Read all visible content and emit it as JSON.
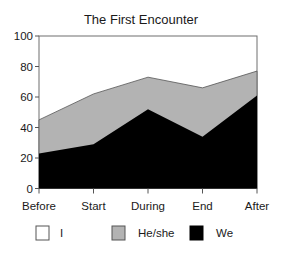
{
  "chart_data": {
    "type": "area",
    "stacked": true,
    "title": "The First Encounter",
    "xlabel": "",
    "ylabel": "",
    "categories": [
      "Before",
      "Start",
      "During",
      "End",
      "After"
    ],
    "ylim": [
      0,
      100
    ],
    "yticks": [
      0,
      20,
      40,
      60,
      80,
      100
    ],
    "grid": false,
    "legend_position": "bottom",
    "series": [
      {
        "name": "We",
        "color": "#000000",
        "values": [
          23,
          29,
          52,
          34,
          61
        ]
      },
      {
        "name": "He/she",
        "color": "#b3b3b3",
        "values": [
          22,
          33,
          21,
          32,
          16
        ]
      },
      {
        "name": "I",
        "color": "#ffffff",
        "values": [
          0,
          0,
          0,
          0,
          0
        ]
      }
    ],
    "cumulative_top": [
      45,
      62,
      73,
      66,
      77
    ]
  },
  "legend": {
    "items": [
      {
        "label": "I",
        "color": "#ffffff"
      },
      {
        "label": "He/she",
        "color": "#b3b3b3"
      },
      {
        "label": "We",
        "color": "#000000"
      }
    ]
  }
}
